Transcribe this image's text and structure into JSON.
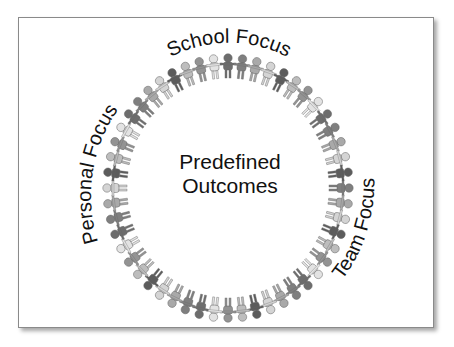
{
  "diagram": {
    "center_label_lines": [
      "Predefined",
      "Outcomes"
    ],
    "arc_labels": {
      "top": "School Focus",
      "left": "Personal Focus",
      "right": "Team Focus"
    },
    "ring": {
      "figure_count": 52,
      "figure_shades": [
        "#7f7f7f",
        "#a9a9a9",
        "#d4d4d4",
        "#5c5c5c",
        "#bdbdbd",
        "#939393",
        "#e3e3e3",
        "#6d6d6d"
      ],
      "center_x": 228,
      "center_y": 188,
      "radius_x": 112,
      "radius_y": 121
    },
    "frame_border_color": "#8a8a8a",
    "text_color": "#111111"
  }
}
